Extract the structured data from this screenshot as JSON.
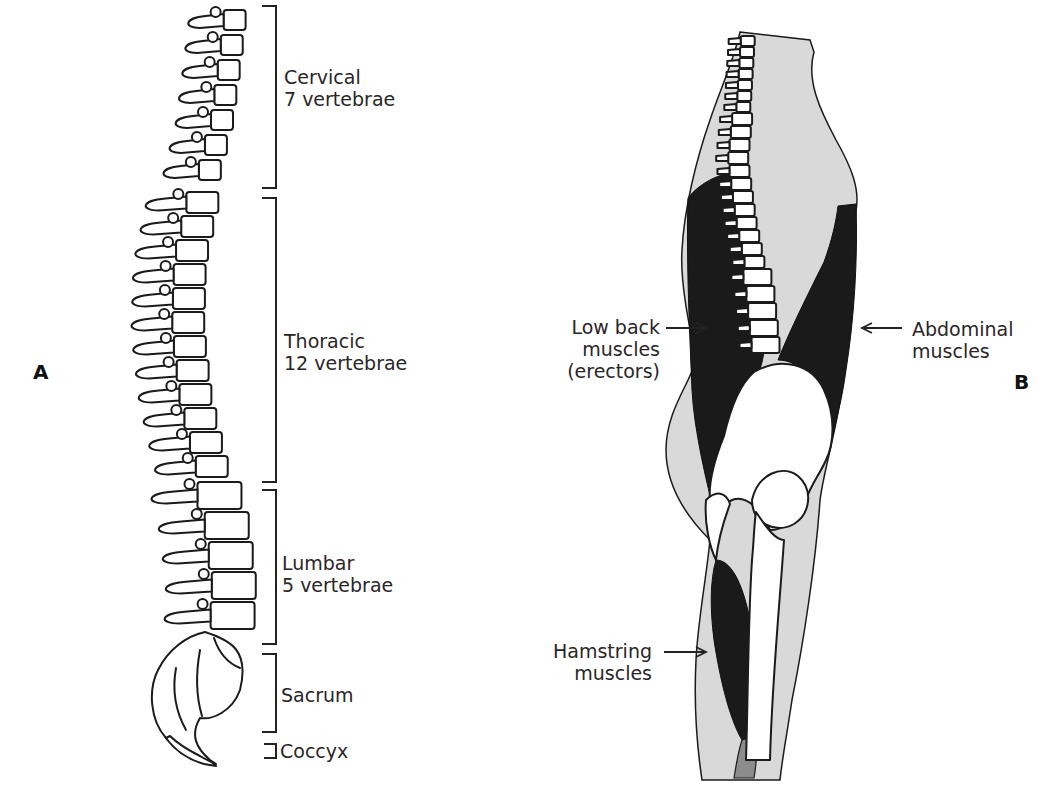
{
  "figure": {
    "panel_a": {
      "letter": "A",
      "subject": "spine-lateral-view",
      "regions": [
        {
          "name": "Cervical",
          "count_label": "7 vertebrae"
        },
        {
          "name": "Thoracic",
          "count_label": "12 vertebrae"
        },
        {
          "name": "Lumbar",
          "count_label": "5 vertebrae"
        },
        {
          "name": "Sacrum",
          "count_label": ""
        },
        {
          "name": "Coccyx",
          "count_label": ""
        }
      ]
    },
    "panel_b": {
      "letter": "B",
      "subject": "trunk-muscles-lateral-view",
      "labels": {
        "low_back": [
          "Low back",
          "muscles",
          "(erectors)"
        ],
        "abdominal": [
          "Abdominal",
          "muscles"
        ],
        "hamstring": [
          "Hamstring",
          "muscles"
        ]
      }
    },
    "colors": {
      "ink": "#1c1a1a",
      "soft_tissue": "#d9d9d9",
      "muscle": "#1a1a1a",
      "bone": "#ffffff",
      "background": "#ffffff"
    }
  }
}
